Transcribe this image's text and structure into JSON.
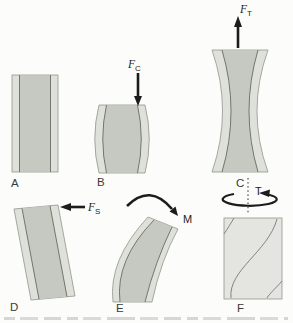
{
  "figure": {
    "colors": {
      "background": "#fcfcfa",
      "outer_band": "#dee0da",
      "inner_band": "#c6c8c2",
      "twist_fill": "#e4e5e0",
      "band_outline": "#93948c",
      "inner_line": "#74756d",
      "arrow": "#1c1c1c",
      "letter_text": "#3a3a3a"
    },
    "panels": {
      "a": {
        "letter": "A"
      },
      "b": {
        "letter": "B",
        "force_main": "F",
        "force_sub": "C"
      },
      "c": {
        "letter": "C",
        "force_main": "F",
        "force_sub": "T"
      },
      "d": {
        "letter": "D",
        "force_main": "F",
        "force_sub": "S"
      },
      "e": {
        "letter": "E",
        "moment_label": "M"
      },
      "f": {
        "letter": "F",
        "torsion_label": "T"
      }
    }
  }
}
